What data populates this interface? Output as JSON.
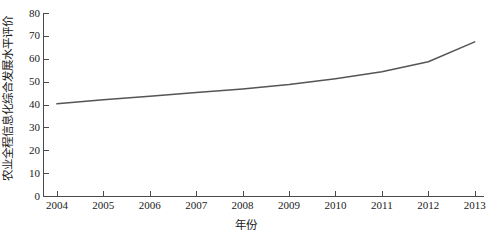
{
  "chart_data": {
    "type": "line",
    "title": "",
    "xlabel": "年份",
    "ylabel": "农业全程信息化综合发展水平评价",
    "categories": [
      "2004",
      "2005",
      "2006",
      "2007",
      "2008",
      "2009",
      "2010",
      "2011",
      "2012",
      "2013"
    ],
    "x": [
      2004,
      2005,
      2006,
      2007,
      2008,
      2009,
      2010,
      2011,
      2012,
      2013
    ],
    "series": [
      {
        "name": "农业全程信息化综合发展水平评价",
        "values": [
          40.3,
          42.1,
          43.6,
          45.2,
          46.8,
          48.7,
          51.3,
          54.3,
          58.7,
          67.4
        ],
        "color": "#555555",
        "linewidth": 1.5
      }
    ],
    "xlim": [
      2003.7,
      2013.2
    ],
    "ylim": [
      0,
      80
    ],
    "yticks": [
      0,
      10,
      20,
      30,
      40,
      50,
      60,
      70,
      80
    ],
    "ytick_labels": [
      "0",
      "10",
      "20",
      "30",
      "40",
      "50",
      "60",
      "70",
      "80"
    ],
    "xticks": [
      2004,
      2005,
      2006,
      2007,
      2008,
      2009,
      2010,
      2011,
      2012,
      2013
    ],
    "xtick_labels": [
      "2004",
      "2005",
      "2006",
      "2007",
      "2008",
      "2009",
      "2010",
      "2011",
      "2012",
      "2013"
    ],
    "grid": false,
    "legend": false,
    "legend_position": "none",
    "axis_color": "#4a4a4a",
    "background": "#ffffff"
  }
}
